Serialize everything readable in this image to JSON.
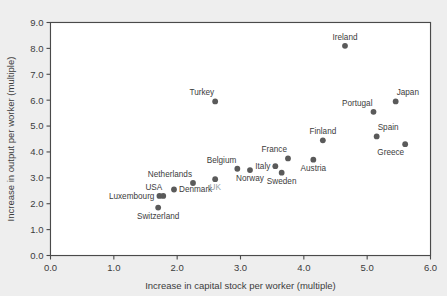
{
  "figure": {
    "background_color": "#eeeeee",
    "plot_background_color": "#ffffff",
    "marker_color": "#5a5a5a",
    "grid_color": "#c9c9c9",
    "axis_color": "#4a4a4a",
    "muted_label_color": "#9aa0a6",
    "clipped_title": ""
  },
  "chart_data": {
    "type": "scatter",
    "title": "",
    "xlabel": "Increase in capital stock per worker (multiple)",
    "ylabel": "Increase in output per worker (multiple)",
    "xlim": [
      0.0,
      6.0
    ],
    "ylim": [
      0.0,
      9.0
    ],
    "xticks": [
      "0.0",
      "1.0",
      "2.0",
      "3.0",
      "4.0",
      "5.0",
      "6.0"
    ],
    "xtick_values": [
      0.0,
      1.0,
      2.0,
      3.0,
      4.0,
      5.0,
      6.0
    ],
    "yticks": [
      "0.0",
      "1.0",
      "2.0",
      "3.0",
      "4.0",
      "5.0",
      "6.0",
      "7.0",
      "8.0",
      "9.0"
    ],
    "ytick_values": [
      0.0,
      1.0,
      2.0,
      3.0,
      4.0,
      5.0,
      6.0,
      7.0,
      8.0,
      9.0
    ],
    "grid": true,
    "grid_axis": "both",
    "legend": false,
    "legend_position": "none",
    "points": [
      {
        "label": "Switzerland",
        "x": 1.7,
        "y": 1.85,
        "label_pos": "below",
        "muted": false
      },
      {
        "label": "Luxembourg",
        "x": 1.72,
        "y": 2.3,
        "label_pos": "left",
        "muted": false
      },
      {
        "label": "USA",
        "x": 1.78,
        "y": 2.3,
        "label_pos": "above-left",
        "muted": false
      },
      {
        "label": "Denmark",
        "x": 1.95,
        "y": 2.55,
        "label_pos": "right",
        "muted": false
      },
      {
        "label": "Netherlands",
        "x": 2.25,
        "y": 2.8,
        "label_pos": "above-left",
        "muted": false
      },
      {
        "label": "UK",
        "x": 2.6,
        "y": 2.95,
        "label_pos": "below",
        "muted": true
      },
      {
        "label": "Turkey",
        "x": 2.6,
        "y": 5.95,
        "label_pos": "above-left",
        "muted": false
      },
      {
        "label": "Belgium",
        "x": 2.95,
        "y": 3.35,
        "label_pos": "above-left",
        "muted": false
      },
      {
        "label": "Norway",
        "x": 3.15,
        "y": 3.3,
        "label_pos": "below",
        "muted": false
      },
      {
        "label": "Italy",
        "x": 3.55,
        "y": 3.45,
        "label_pos": "left",
        "muted": false
      },
      {
        "label": "Sweden",
        "x": 3.65,
        "y": 3.2,
        "label_pos": "below",
        "muted": false
      },
      {
        "label": "France",
        "x": 3.75,
        "y": 3.75,
        "label_pos": "above-left",
        "muted": false
      },
      {
        "label": "Austria",
        "x": 4.15,
        "y": 3.7,
        "label_pos": "below",
        "muted": false
      },
      {
        "label": "Finland",
        "x": 4.3,
        "y": 4.45,
        "label_pos": "above",
        "muted": false
      },
      {
        "label": "Ireland",
        "x": 4.65,
        "y": 8.1,
        "label_pos": "above",
        "muted": false
      },
      {
        "label": "Portugal",
        "x": 5.1,
        "y": 5.55,
        "label_pos": "above-left",
        "muted": false
      },
      {
        "label": "Spain",
        "x": 5.15,
        "y": 4.6,
        "label_pos": "above-right",
        "muted": false
      },
      {
        "label": "Japan",
        "x": 5.45,
        "y": 5.95,
        "label_pos": "above-right",
        "muted": false
      },
      {
        "label": "Greece",
        "x": 5.6,
        "y": 4.3,
        "label_pos": "below-left",
        "muted": false
      }
    ]
  }
}
